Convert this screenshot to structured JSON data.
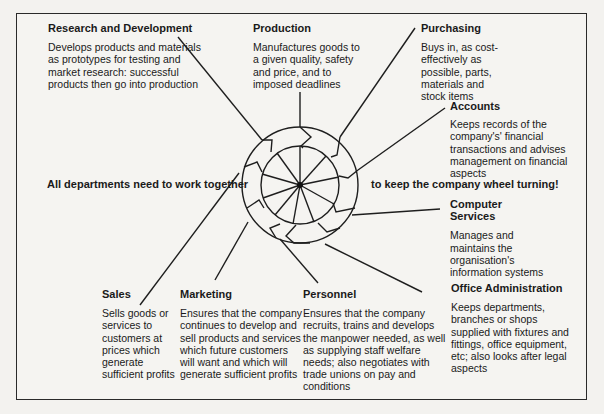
{
  "diagram": {
    "slogan_left": "All departments need to work together",
    "slogan_right": "to keep the company wheel turning!",
    "departments": [
      {
        "id": "research",
        "title": "Research and Development",
        "desc": "Develops products and materials as prototypes for testing and market research: successful products then go into production"
      },
      {
        "id": "production",
        "title": "Production",
        "desc": "Manufactures goods to a given quality, safety and price, and to imposed deadlines"
      },
      {
        "id": "purchasing",
        "title": "Purchasing",
        "desc": "Buys in, as cost-effectively as possible, parts, materials and stock items"
      },
      {
        "id": "accounts",
        "title": "Accounts",
        "desc": "Keeps records of the company's' financial transactions and advises management on financial aspects"
      },
      {
        "id": "computer",
        "title": "Computer Services",
        "desc": "Manages and maintains the organisation's information systems"
      },
      {
        "id": "office",
        "title": "Office Administration",
        "desc": "Keeps departments, branches or shops supplied with fixtures and fittings, office equipment, etc; also looks after legal aspects"
      },
      {
        "id": "personnel",
        "title": "Personnel",
        "desc": "Ensures that the company recruits, trains and develops the manpower needed, as well as supplying staff welfare needs; also negotiates with trade unions on pay and conditions"
      },
      {
        "id": "marketing",
        "title": "Marketing",
        "desc": "Ensures that the company continues to develop and sell products and services which future customers will want and which will generate sufficient profits"
      },
      {
        "id": "sales",
        "title": "Sales",
        "desc": "Sells goods or services to customers at prices which generate sufficient profits"
      }
    ]
  }
}
